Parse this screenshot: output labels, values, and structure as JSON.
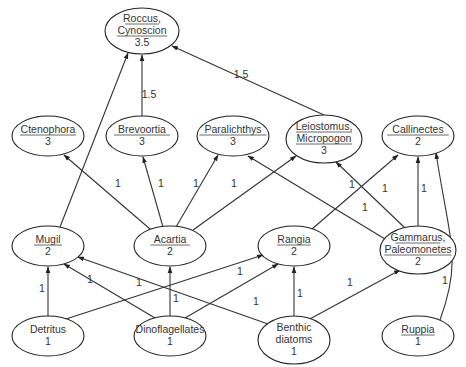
{
  "diagram": {
    "type": "food-web",
    "nodes": [
      {
        "id": "roccus",
        "lines": [
          "Roccus,",
          "Cynoscion"
        ],
        "level": "3.5",
        "underlined": true,
        "cx": 142,
        "cy": 31,
        "rx": 37,
        "ry": 23
      },
      {
        "id": "ctenophora",
        "lines": [
          "Ctenophora"
        ],
        "level": "3",
        "underlined": true,
        "cx": 48,
        "cy": 136,
        "rx": 36,
        "ry": 20
      },
      {
        "id": "brevoortia",
        "lines": [
          "Brevoortia"
        ],
        "level": "3",
        "underlined": true,
        "cx": 142,
        "cy": 136,
        "rx": 36,
        "ry": 20
      },
      {
        "id": "paralichthys",
        "lines": [
          "Paralichthys"
        ],
        "level": "3",
        "underlined": true,
        "cx": 233,
        "cy": 136,
        "rx": 36,
        "ry": 20
      },
      {
        "id": "leiostomus",
        "lines": [
          "Leiostomus,",
          "Micropogon"
        ],
        "level": "3",
        "underlined": true,
        "cx": 324,
        "cy": 139,
        "rx": 38,
        "ry": 24
      },
      {
        "id": "callinectes",
        "lines": [
          "Callinectes"
        ],
        "level": "2",
        "underlined": true,
        "cx": 418,
        "cy": 136,
        "rx": 36,
        "ry": 20
      },
      {
        "id": "mugil",
        "lines": [
          "Mugil"
        ],
        "level": "2",
        "underlined": true,
        "cx": 48,
        "cy": 246,
        "rx": 36,
        "ry": 20
      },
      {
        "id": "acartia",
        "lines": [
          "Acartia"
        ],
        "level": "2",
        "underlined": true,
        "cx": 170,
        "cy": 246,
        "rx": 36,
        "ry": 20
      },
      {
        "id": "rangia",
        "lines": [
          "Rangia"
        ],
        "level": "2",
        "underlined": true,
        "cx": 294,
        "cy": 246,
        "rx": 36,
        "ry": 20
      },
      {
        "id": "gammarus",
        "lines": [
          "Gammarus,",
          "Paleomonetes"
        ],
        "level": "2",
        "underlined": true,
        "cx": 418,
        "cy": 250,
        "rx": 38,
        "ry": 24
      },
      {
        "id": "detritus",
        "lines": [
          "Detritus"
        ],
        "level": "1",
        "underlined": false,
        "cx": 48,
        "cy": 336,
        "rx": 36,
        "ry": 20
      },
      {
        "id": "dinoflagellates",
        "lines": [
          "Dinoflagellates"
        ],
        "level": "1",
        "underlined": false,
        "cx": 170,
        "cy": 336,
        "rx": 36,
        "ry": 20
      },
      {
        "id": "benthic",
        "lines": [
          "Benthic",
          "diatoms"
        ],
        "level": "1",
        "underlined": false,
        "cx": 294,
        "cy": 340,
        "rx": 36,
        "ry": 24
      },
      {
        "id": "ruppia",
        "lines": [
          "Ruppia"
        ],
        "level": "1",
        "underlined": true,
        "cx": 418,
        "cy": 336,
        "rx": 36,
        "ry": 20
      }
    ],
    "edges": [
      {
        "from": "mugil",
        "to": "roccus",
        "label": "1.5",
        "x1": 60,
        "y1": 227,
        "x2": 128,
        "y2": 53,
        "lx": 42,
        "ly": 124
      },
      {
        "from": "brevoortia",
        "to": "roccus",
        "label": "1.5",
        "x1": 142,
        "y1": 116,
        "x2": 142,
        "y2": 55,
        "lx": 149,
        "ly": 98
      },
      {
        "from": "leiostomus",
        "to": "roccus",
        "label": "1.5",
        "x1": 324,
        "y1": 115,
        "x2": 172,
        "y2": 46,
        "lx": 241,
        "ly": 78
      },
      {
        "from": "acartia",
        "to": "ctenophora",
        "label": "1",
        "x1": 150,
        "y1": 229,
        "x2": 64,
        "y2": 155,
        "lx": 118,
        "ly": 187
      },
      {
        "from": "acartia",
        "to": "brevoortia",
        "label": "1",
        "x1": 163,
        "y1": 227,
        "x2": 143,
        "y2": 157,
        "lx": 161,
        "ly": 187
      },
      {
        "from": "acartia",
        "to": "paralichthys",
        "label": "1",
        "x1": 176,
        "y1": 227,
        "x2": 218,
        "y2": 155,
        "lx": 196,
        "ly": 187
      },
      {
        "from": "acartia",
        "to": "leiostomus",
        "label": "1",
        "x1": 193,
        "y1": 230,
        "x2": 296,
        "y2": 156,
        "lx": 234,
        "ly": 187
      },
      {
        "from": "gammarus",
        "to": "paralichthys",
        "label": "1",
        "x1": 385,
        "y1": 239,
        "x2": 248,
        "y2": 156,
        "lx": 365,
        "ly": 211
      },
      {
        "from": "gammarus",
        "to": "leiostomus",
        "label": "1",
        "x1": 405,
        "y1": 228,
        "x2": 336,
        "y2": 162,
        "lx": 385,
        "ly": 192
      },
      {
        "from": "rangia",
        "to": "callinectes",
        "label": "1",
        "x1": 312,
        "y1": 229,
        "x2": 398,
        "y2": 155,
        "lx": 352,
        "ly": 188
      },
      {
        "from": "gammarus",
        "to": "callinectes",
        "label": "1",
        "x1": 418,
        "y1": 226,
        "x2": 418,
        "y2": 157,
        "lx": 424,
        "ly": 192
      },
      {
        "from": "detritus",
        "to": "mugil",
        "label": "1",
        "x1": 48,
        "y1": 316,
        "x2": 48,
        "y2": 267,
        "lx": 42,
        "ly": 292
      },
      {
        "from": "dinoflagellates",
        "to": "mugil",
        "label": "1",
        "x1": 155,
        "y1": 318,
        "x2": 64,
        "y2": 264,
        "lx": 90,
        "ly": 283
      },
      {
        "from": "benthic",
        "to": "mugil",
        "label": "1",
        "x1": 268,
        "y1": 324,
        "x2": 78,
        "y2": 257,
        "lx": 256,
        "ly": 305
      },
      {
        "from": "dinoflagellates",
        "to": "acartia",
        "label": "1",
        "x1": 170,
        "y1": 316,
        "x2": 170,
        "y2": 267,
        "lx": 176,
        "ly": 302
      },
      {
        "from": "detritus",
        "to": "rangia",
        "label": "1",
        "x1": 66,
        "y1": 319,
        "x2": 263,
        "y2": 255,
        "lx": 139,
        "ly": 286
      },
      {
        "from": "dinoflagellates",
        "to": "rangia",
        "label": "1",
        "x1": 185,
        "y1": 318,
        "x2": 278,
        "y2": 264,
        "lx": 240,
        "ly": 275
      },
      {
        "from": "benthic",
        "to": "rangia",
        "label": "1",
        "x1": 294,
        "y1": 316,
        "x2": 294,
        "y2": 267,
        "lx": 300,
        "ly": 297
      },
      {
        "from": "benthic",
        "to": "gammarus",
        "label": "1",
        "x1": 308,
        "y1": 320,
        "x2": 400,
        "y2": 270,
        "lx": 350,
        "ly": 286
      },
      {
        "from": "ruppia",
        "to": "callinectes",
        "label": "1",
        "x1": 440,
        "y1": 320,
        "x2": 440,
        "y2": 153,
        "lx": 445,
        "ly": 284,
        "curved": true
      }
    ]
  }
}
